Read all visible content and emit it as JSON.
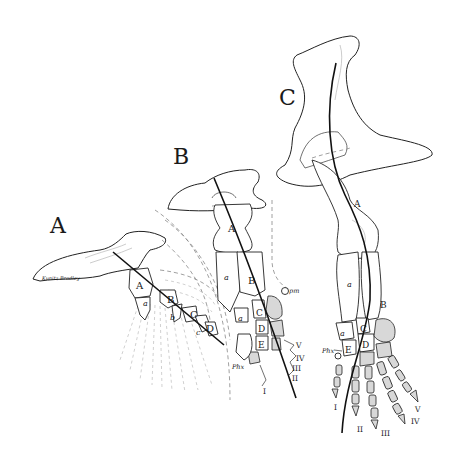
{
  "figure": {
    "signature": "Kunitz Bradley",
    "panels": [
      {
        "id": "A",
        "letter": "A",
        "bone_labels": [
          "A",
          "B",
          "C",
          "D"
        ],
        "radial_labels": [
          "a",
          "b",
          "c"
        ]
      },
      {
        "id": "B",
        "letter": "B",
        "bone_labels": [
          "A",
          "B",
          "C",
          "D",
          "E"
        ],
        "radial_labels": [
          "a",
          "a"
        ],
        "annotations": [
          "pm",
          "Phx"
        ],
        "digit_labels": [
          "I",
          "II",
          "III",
          "IV",
          "V"
        ]
      },
      {
        "id": "C",
        "letter": "C",
        "bone_labels": [
          "A",
          "B",
          "C",
          "D",
          "E"
        ],
        "radial_labels": [
          "a",
          "a"
        ],
        "annotations": [
          "Phx"
        ],
        "digit_labels": [
          "I",
          "II",
          "III",
          "IV",
          "V"
        ]
      }
    ]
  }
}
